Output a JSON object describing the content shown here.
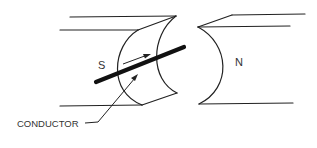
{
  "diagram": {
    "type": "magnet-conductor-illustration",
    "labels": {
      "south_pole": "S",
      "north_pole": "N",
      "conductor": "CONDUCTOR"
    },
    "colors": {
      "line": "#222222",
      "conductor": "#111111",
      "text": "#333333",
      "background": "#ffffff"
    }
  }
}
